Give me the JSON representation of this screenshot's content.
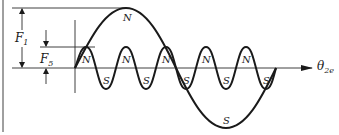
{
  "figure": {
    "axis_label": {
      "symbol": "θ",
      "subscript": "2e"
    },
    "dimensions": [
      {
        "symbol": "F",
        "subscript": "1"
      },
      {
        "symbol": "F",
        "subscript": "5"
      }
    ],
    "large_wave": {
      "peak_label": "N",
      "trough_label": "S"
    },
    "small_wave": {
      "peak_labels": [
        "N",
        "N",
        "N",
        "N",
        "N"
      ],
      "trough_labels": [
        "S",
        "S",
        "S",
        "S",
        "S"
      ]
    },
    "colors": {
      "stroke": "#1a1a1a",
      "background": "#ffffff"
    }
  }
}
